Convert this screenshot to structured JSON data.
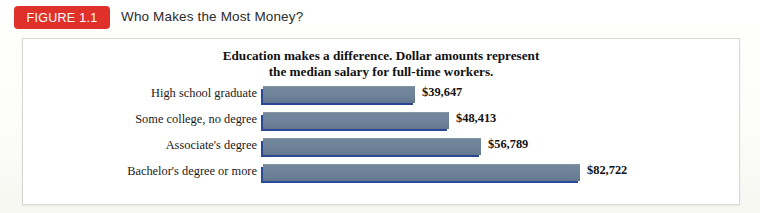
{
  "figure": {
    "badge_label": "FIGURE 1.1",
    "title": "Who Makes the Most Money?",
    "badge_color": "#e0302a"
  },
  "chart_data": {
    "type": "bar",
    "orientation": "horizontal",
    "title": "Education makes a difference. Dollar amounts represent the median salary for full-time workers.",
    "title_line1": "Education makes a difference. Dollar amounts represent",
    "title_line2": "the median salary for full-time workers.",
    "xlabel": "",
    "ylabel": "",
    "grid": false,
    "legend": "none",
    "xlim": [
      0,
      90000
    ],
    "categories": [
      "High school graduate",
      "Some college, no degree",
      "Associate's degree",
      "Bachelor's degree or more"
    ],
    "values": [
      39647,
      48413,
      56789,
      82722
    ],
    "value_labels": [
      "$39,647",
      "$48,413",
      "$56,789",
      "$82,722"
    ],
    "bar_face_color": "#6d8299",
    "bar_shadow_color": "#2b4896"
  }
}
